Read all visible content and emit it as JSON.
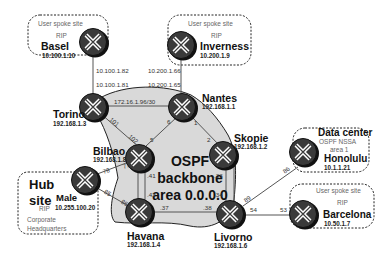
{
  "backbone": {
    "line1": "OSPF",
    "line2": "backbone",
    "line3": "area 0.0.0.0",
    "fill": "#d9d9d9"
  },
  "routers": {
    "basel": {
      "name": "Basel",
      "address": "10.100.1.10"
    },
    "inverness": {
      "name": "Inverness",
      "address": "10.200.1.9"
    },
    "torino": {
      "name": "Torino",
      "address": "192.168.1.3"
    },
    "nantes": {
      "name": "Nantes",
      "address": "192.168.1.1"
    },
    "bilbao": {
      "name": "Bilbao",
      "address": "192.168.1.8"
    },
    "skopie": {
      "name": "Skopie",
      "address": "192.168.1.2"
    },
    "male": {
      "name": "Male",
      "address": "10.255.100.20"
    },
    "havana": {
      "name": "Havana",
      "address": "192.168.1.4"
    },
    "livorno": {
      "name": "Livorno",
      "address": "192.168.1.6"
    },
    "honolulu": {
      "name": "Honolulu",
      "address": "10.1.1.21"
    },
    "barcelona": {
      "name": "Barcelona",
      "address": "10.50.1.7"
    }
  },
  "sites": {
    "basel": {
      "type": "User spoke site",
      "protocol": "RIP"
    },
    "inverness": {
      "type": "User spoke site",
      "protocol": "RIP"
    },
    "hub": {
      "title1": "Hub",
      "title2": "site",
      "protocol": "RIP",
      "note1": "Corporate",
      "note2": "Headquarters"
    },
    "datacenter": {
      "title": "Data center",
      "protocol": "OSPF NSSA",
      "area": "area 1"
    },
    "barcelona": {
      "type": "User spoke site",
      "protocol": "RIP"
    }
  },
  "links": {
    "basel_torino": {
      "a": "10.100.1.82",
      "b": "10.100.1.81"
    },
    "inverness_nantes": {
      "a": "10.200.1.66",
      "b": "10.200.1.65"
    },
    "torino_nantes": {
      "subnet": "172.16.1.96/30"
    },
    "torino_bilbao": {
      "a": "101",
      "b": "102"
    },
    "nantes_bilbao": {
      "a": "6",
      "b": "5"
    },
    "nantes_skopie": {
      "a": "1",
      "b": "2"
    },
    "male_bilbao": {
      "a": "78",
      "b": "77"
    },
    "male_havana": {
      "a": "85",
      "b": "86"
    },
    "bilbao_havana": {
      "a": ".41",
      "b": ".42"
    },
    "skopie_livorno": {
      "a": ".33",
      "b": ".34"
    },
    "havana_livorno": {
      "a": ".37",
      "b": ".38"
    },
    "livorno_honolulu": {
      "a": "89",
      "b": "86"
    },
    "livorno_barcelona": {
      "a": "54",
      "b": "53"
    }
  }
}
